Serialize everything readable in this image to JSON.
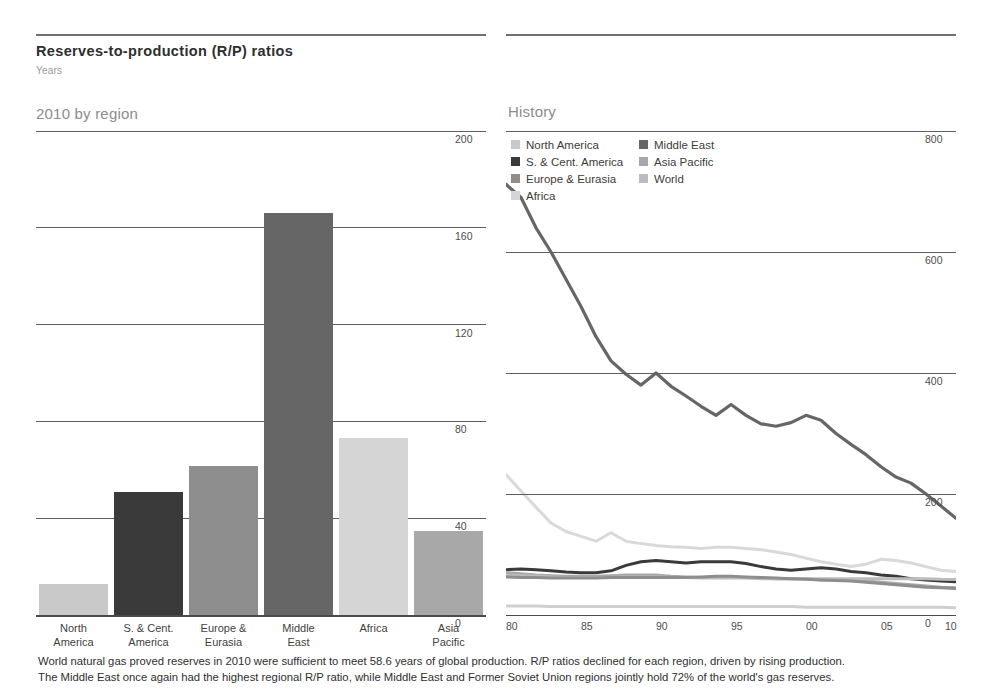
{
  "header": {
    "title": "Reserves-to-production (R/P) ratios",
    "subtitle": "Years"
  },
  "panels": {
    "left_heading": "2010 by region",
    "right_heading": "History"
  },
  "caption": {
    "line1": "World natural gas proved reserves in 2010 were sufficient to meet 58.6 years of global production. R/P ratios declined for each region, driven by rising production.",
    "line2": "The Middle East once again had the highest regional R/P ratio, while Middle East and Former Soviet Union regions jointly hold 72% of the world's gas reserves."
  },
  "colors": {
    "north_america": "#c9c9c9",
    "s_cent_america": "#3a3a3a",
    "europe_eurasia": "#8e8e8e",
    "africa": "#d5d5d5",
    "middle_east": "#666666",
    "asia_pacific": "#a8a8a8",
    "world": "#bcbcbc",
    "gridline": "#5e5e5e",
    "text": "#3a3a3a"
  },
  "legend": {
    "column1": [
      {
        "label": "North America",
        "color": "#c9c9c9"
      },
      {
        "label": "S. & Cent. America",
        "color": "#3a3a3a"
      },
      {
        "label": "Europe & Eurasia",
        "color": "#8e8e8e"
      },
      {
        "label": "Africa",
        "color": "#d5d5d5"
      }
    ],
    "column2": [
      {
        "label": "Middle East",
        "color": "#666666"
      },
      {
        "label": "Asia Pacific",
        "color": "#a8a8a8"
      },
      {
        "label": "World",
        "color": "#bcbcbc"
      }
    ]
  },
  "chart_data": [
    {
      "type": "bar",
      "title": "2010 by region",
      "xlabel": "",
      "ylabel": "Years",
      "ylim": [
        0,
        200
      ],
      "yticks": [
        0,
        40,
        80,
        120,
        160,
        200
      ],
      "grid": true,
      "categories": [
        "North America",
        "S. & Cent. America",
        "Europe & Eurasia",
        "Middle East",
        "Africa",
        "Asia Pacific"
      ],
      "category_lines": [
        [
          "North",
          "America"
        ],
        [
          "S. & Cent.",
          "America"
        ],
        [
          "Europe &",
          "Eurasia"
        ],
        [
          "Middle",
          "East"
        ],
        [
          "Africa",
          ""
        ],
        [
          "Asia",
          "Pacific"
        ]
      ],
      "values": [
        12.9,
        51.0,
        61.7,
        166.0,
        73.0,
        34.6
      ],
      "bar_colors": [
        "#c9c9c9",
        "#3a3a3a",
        "#8e8e8e",
        "#666666",
        "#d5d5d5",
        "#a8a8a8"
      ]
    },
    {
      "type": "line",
      "title": "History",
      "xlabel": "",
      "ylabel": "Years",
      "ylim": [
        0,
        800
      ],
      "yticks": [
        0,
        200,
        400,
        600,
        800
      ],
      "xlim": [
        1980,
        2010
      ],
      "xticks": [
        1980,
        1985,
        1990,
        1995,
        2000,
        2005,
        2010
      ],
      "xticklabels": [
        "80",
        "85",
        "90",
        "95",
        "00",
        "05",
        "10"
      ],
      "grid": true,
      "legend_position": "top-left",
      "x": [
        1980,
        1981,
        1982,
        1983,
        1984,
        1985,
        1986,
        1987,
        1988,
        1989,
        1990,
        1991,
        1992,
        1993,
        1994,
        1995,
        1996,
        1997,
        1998,
        1999,
        2000,
        2001,
        2002,
        2003,
        2004,
        2005,
        2006,
        2007,
        2008,
        2009,
        2010
      ],
      "series": [
        {
          "name": "Middle East",
          "color": "#666666",
          "width": 3.2,
          "values": [
            712,
            690,
            640,
            600,
            555,
            510,
            460,
            420,
            398,
            380,
            400,
            378,
            362,
            345,
            330,
            348,
            330,
            316,
            312,
            318,
            330,
            322,
            300,
            282,
            265,
            245,
            228,
            218,
            200,
            180,
            160
          ]
        },
        {
          "name": "Africa",
          "color": "#d9d9d9",
          "width": 3.0,
          "values": [
            232,
            205,
            178,
            152,
            138,
            130,
            122,
            136,
            122,
            118,
            115,
            113,
            112,
            110,
            112,
            112,
            110,
            108,
            104,
            100,
            94,
            88,
            84,
            80,
            84,
            92,
            90,
            86,
            80,
            74,
            72
          ]
        },
        {
          "name": "S. & Cent. America",
          "color": "#3a3a3a",
          "width": 3.0,
          "values": [
            75,
            76,
            75,
            73,
            71,
            70,
            70,
            73,
            82,
            88,
            90,
            88,
            86,
            88,
            88,
            88,
            85,
            80,
            76,
            74,
            76,
            78,
            76,
            72,
            70,
            66,
            64,
            60,
            58,
            56,
            55
          ]
        },
        {
          "name": "Asia Pacific",
          "color": "#a8a8a8",
          "width": 3.0,
          "values": [
            70,
            68,
            66,
            65,
            64,
            64,
            64,
            65,
            66,
            66,
            66,
            64,
            63,
            62,
            62,
            62,
            62,
            61,
            60,
            60,
            60,
            58,
            58,
            57,
            56,
            54,
            52,
            50,
            48,
            46,
            45
          ]
        },
        {
          "name": "World",
          "color": "#bcbcbc",
          "width": 3.0,
          "values": [
            66,
            65,
            64,
            63,
            62,
            62,
            62,
            62,
            63,
            63,
            63,
            62,
            62,
            61,
            61,
            61,
            61,
            60,
            60,
            60,
            60,
            60,
            60,
            60,
            60,
            60,
            60,
            60,
            60,
            59,
            58.6
          ]
        },
        {
          "name": "Europe & Eurasia",
          "color": "#8e8e8e",
          "width": 3.0,
          "values": [
            63,
            62,
            62,
            61,
            61,
            61,
            61,
            62,
            62,
            62,
            62,
            62,
            62,
            63,
            64,
            64,
            63,
            62,
            61,
            60,
            59,
            58,
            57,
            56,
            54,
            52,
            50,
            48,
            46,
            45,
            44
          ]
        },
        {
          "name": "North America",
          "color": "#cfcfcf",
          "width": 3.0,
          "values": [
            15,
            15,
            15,
            14,
            14,
            14,
            14,
            14,
            14,
            14,
            14,
            14,
            14,
            14,
            14,
            14,
            14,
            14,
            14,
            14,
            13,
            13,
            13,
            13,
            13,
            13,
            13,
            13,
            13,
            13,
            12
          ]
        }
      ]
    }
  ]
}
